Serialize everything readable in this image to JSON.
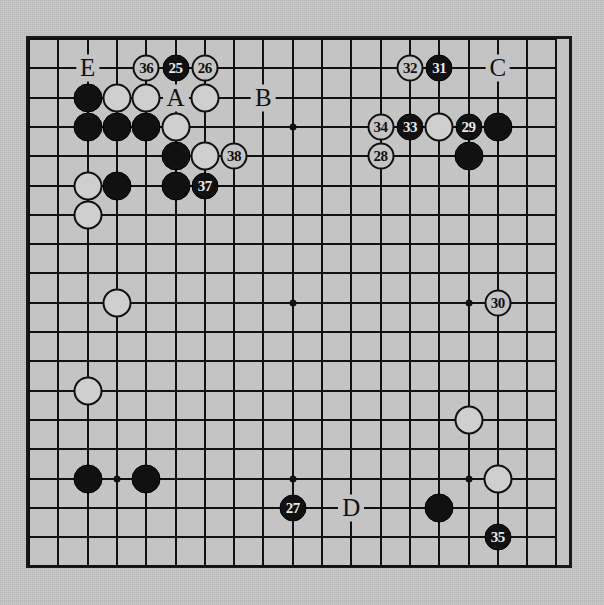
{
  "board": {
    "title": "Go game diagram",
    "size": 19,
    "visible_cols": 19,
    "visible_rows": 19,
    "origin_x": 27,
    "origin_y": 37,
    "spacing": 29.3,
    "colors": {
      "paper": "#c7c7c7",
      "board": "#c4c4c4",
      "line": "#111111",
      "black_stone": "#111111",
      "white_stone": "#cfcfcf"
    },
    "star_points": [
      {
        "c": 3,
        "r": 3
      },
      {
        "c": 9,
        "r": 3
      },
      {
        "c": 15,
        "r": 3
      },
      {
        "c": 3,
        "r": 9
      },
      {
        "c": 9,
        "r": 9
      },
      {
        "c": 15,
        "r": 9
      },
      {
        "c": 3,
        "r": 15
      },
      {
        "c": 9,
        "r": 15
      },
      {
        "c": 15,
        "r": 15
      }
    ],
    "stones": [
      {
        "c": 2,
        "r": 2,
        "color": "black"
      },
      {
        "c": 3,
        "r": 2,
        "color": "white"
      },
      {
        "c": 4,
        "r": 2,
        "color": "white"
      },
      {
        "c": 6,
        "r": 2,
        "color": "white"
      },
      {
        "c": 2,
        "r": 3,
        "color": "black"
      },
      {
        "c": 3,
        "r": 3,
        "color": "black"
      },
      {
        "c": 4,
        "r": 3,
        "color": "black"
      },
      {
        "c": 5,
        "r": 3,
        "color": "white"
      },
      {
        "c": 5,
        "r": 4,
        "color": "black"
      },
      {
        "c": 6,
        "r": 4,
        "color": "white"
      },
      {
        "c": 2,
        "r": 5,
        "color": "white"
      },
      {
        "c": 3,
        "r": 5,
        "color": "black"
      },
      {
        "c": 5,
        "r": 5,
        "color": "black"
      },
      {
        "c": 2,
        "r": 6,
        "color": "white"
      },
      {
        "c": 14,
        "r": 3,
        "color": "white"
      },
      {
        "c": 16,
        "r": 3,
        "color": "black"
      },
      {
        "c": 15,
        "r": 4,
        "color": "black"
      },
      {
        "c": 3,
        "r": 9,
        "color": "white"
      },
      {
        "c": 2,
        "r": 12,
        "color": "white"
      },
      {
        "c": 15,
        "r": 13,
        "color": "white"
      },
      {
        "c": 2,
        "r": 15,
        "color": "black"
      },
      {
        "c": 4,
        "r": 15,
        "color": "black"
      },
      {
        "c": 16,
        "r": 15,
        "color": "white"
      },
      {
        "c": 14,
        "r": 16,
        "color": "black"
      }
    ],
    "move_markers": [
      {
        "c": 15,
        "r": 3,
        "label": "29",
        "color": "black"
      },
      {
        "c": 16,
        "r": 9,
        "label": "30",
        "color": "white"
      },
      {
        "c": 14,
        "r": 1,
        "label": "31",
        "color": "black"
      },
      {
        "c": 13,
        "r": 1,
        "label": "32",
        "color": "white"
      },
      {
        "c": 13,
        "r": 3,
        "label": "33",
        "color": "black"
      },
      {
        "c": 12,
        "r": 3,
        "label": "34",
        "color": "white"
      },
      {
        "c": 12,
        "r": 4,
        "label": "28",
        "color": "white"
      },
      {
        "c": 4,
        "r": 1,
        "label": "36",
        "color": "white"
      },
      {
        "c": 5,
        "r": 1,
        "label": "25",
        "color": "black"
      },
      {
        "c": 6,
        "r": 1,
        "label": "26",
        "color": "white"
      },
      {
        "c": 7,
        "r": 4,
        "label": "38",
        "color": "white"
      },
      {
        "c": 6,
        "r": 5,
        "label": "37",
        "color": "black"
      },
      {
        "c": 9,
        "r": 16,
        "label": "27",
        "color": "black"
      },
      {
        "c": 16,
        "r": 17,
        "label": "35",
        "color": "black"
      }
    ],
    "point_labels": [
      {
        "c": 2,
        "r": 1,
        "label": "E"
      },
      {
        "c": 5,
        "r": 2,
        "label": "A"
      },
      {
        "c": 8,
        "r": 2,
        "label": "B"
      },
      {
        "c": 16,
        "r": 1,
        "label": "C"
      },
      {
        "c": 11,
        "r": 16,
        "label": "D"
      }
    ]
  }
}
